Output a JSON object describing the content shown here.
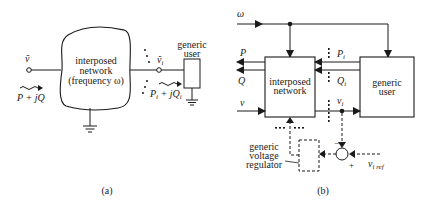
{
  "panel_a": {
    "caption": "(a)",
    "input_voltage": "ṽ",
    "input_power": "P + jQ",
    "network_label_1": "interposed",
    "network_label_2": "network",
    "network_label_3": "(frequency ω)",
    "user_voltage": "ṽ",
    "user_voltage_sub": "i",
    "user_power_1": "P",
    "user_power_sub_1": "i",
    "user_power_2": " + jQ",
    "user_power_sub_2": "i",
    "user_label_1": "generic",
    "user_label_2": "user"
  },
  "panel_b": {
    "caption": "(b)",
    "omega": "ω",
    "P": "P",
    "Q": "Q",
    "v": "v",
    "Pi": "P",
    "Pi_sub": "i",
    "Qi": "Q",
    "Qi_sub": "i",
    "vi": "v",
    "vi_sub": "i",
    "network_label_1": "interposed",
    "network_label_2": "network",
    "user_label_1": "generic",
    "user_label_2": "user",
    "regulator_label_1": "generic",
    "regulator_label_2": "voltage",
    "regulator_label_3": "regulator",
    "minus": "−",
    "plus": "+",
    "vref": "v",
    "vref_sub": "i ref"
  },
  "colors": {
    "ink": "#1a1a1a",
    "background": "#ffffff"
  }
}
